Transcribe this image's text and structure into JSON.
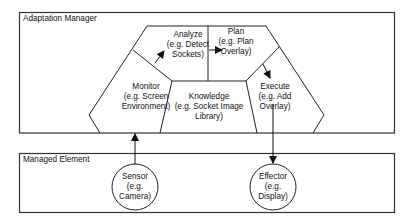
{
  "diagram": {
    "adaptation_manager": {
      "title": "Adaptation Manager",
      "components": {
        "monitor": {
          "name": "Monitor",
          "line2": "(e.g. Screen",
          "line3": "Environment)"
        },
        "analyze": {
          "name": "Analyze",
          "line2": "(e.g. Detect",
          "line3": "Sockets)"
        },
        "plan": {
          "name": "Plan",
          "line2": "(e.g. Plan",
          "line3": "Overlay)"
        },
        "execute": {
          "name": "Execute",
          "line2": "(e.g. Add",
          "line3": "Overlay)"
        },
        "knowledge": {
          "name": "Knowledge",
          "line2": "(e.g. Socket Image",
          "line3": "Library)"
        }
      }
    },
    "managed_element": {
      "title": "Managed Element",
      "sensor": {
        "name": "Sensor",
        "line2": "(e.g.",
        "line3": "Camera)"
      },
      "effector": {
        "name": "Effector",
        "line2": "(e.g.",
        "line3": "Display)"
      }
    },
    "edges": [
      {
        "from": "Monitor",
        "to": "Analyze"
      },
      {
        "from": "Analyze",
        "to": "Plan"
      },
      {
        "from": "Plan",
        "to": "Execute"
      },
      {
        "from": "Sensor",
        "to": "Adaptation Manager"
      },
      {
        "from": "Adaptation Manager",
        "to": "Effector"
      }
    ],
    "colors": {
      "stroke": "#222222",
      "background": "#ffffff",
      "text": "#111111"
    }
  }
}
